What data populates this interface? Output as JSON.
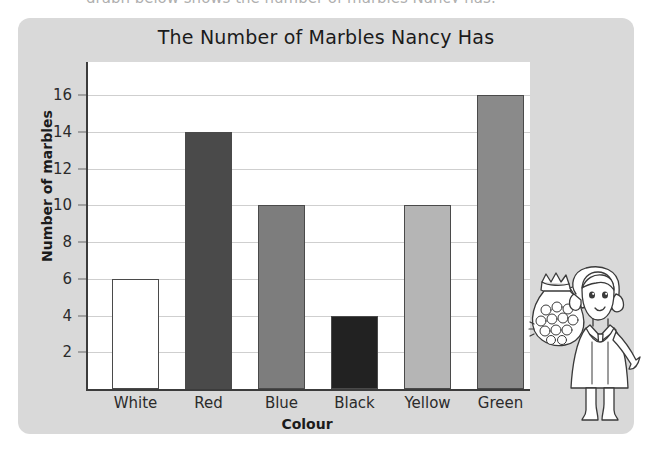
{
  "page": {
    "top_cutoff_text": "graph below shows the number of marbles Nancy has."
  },
  "card": {
    "background_color": "#d9d9d9"
  },
  "chart_data": {
    "type": "bar",
    "title": "The Number of Marbles Nancy Has",
    "xlabel": "Colour",
    "ylabel": "Number of marbles",
    "categories": [
      "White",
      "Red",
      "Blue",
      "Black",
      "Yellow",
      "Green"
    ],
    "values": [
      6,
      14,
      10,
      4,
      10,
      16
    ],
    "bar_colors": [
      "#ffffff",
      "#4a4a4a",
      "#7d7d7d",
      "#222222",
      "#b5b5b5",
      "#8a8a8a"
    ],
    "ylim": [
      0,
      17.8
    ],
    "y_ticks": [
      2,
      4,
      6,
      8,
      10,
      12,
      14,
      16
    ],
    "y_tick_labels": [
      "2",
      "4",
      "6",
      "8",
      "10",
      "12",
      "14",
      "16"
    ],
    "grid": true,
    "grid_color": "#cfcfcf",
    "legend": "none",
    "plot_background": "#ffffff",
    "axis_color": "#3c3c3c"
  },
  "illustration": {
    "name": "girl-holding-bag-of-marbles",
    "description": "Line drawing of a girl in a pinafore dress holding up a tied bag full of marbles"
  }
}
